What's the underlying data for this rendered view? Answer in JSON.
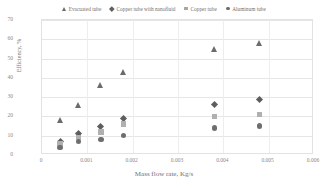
{
  "chart_data": {
    "type": "scatter",
    "title": "",
    "xlabel": "Mass flow rate, Kg/s",
    "ylabel": "Efficiency, %",
    "xlim": [
      0,
      0.006
    ],
    "ylim": [
      0,
      70
    ],
    "xticks": [
      "0",
      "0.001",
      "0.002",
      "0.003",
      "0.004",
      "0.005",
      "0.006"
    ],
    "yticks": [
      "0",
      "10",
      "20",
      "30",
      "40",
      "50",
      "60",
      "70"
    ],
    "grid": true,
    "legend_position": "top",
    "x": [
      0.0004,
      0.0008,
      0.0013,
      0.0018,
      0.0038,
      0.0048
    ],
    "series": [
      {
        "name": "Evacuated tube",
        "marker": "triangle",
        "color": "#6b6b6b",
        "values": [
          18,
          26,
          36,
          43,
          55,
          58
        ]
      },
      {
        "name": "Copper tube with nanofluid",
        "marker": "diamond",
        "color": "#5d5d5d",
        "values": [
          7,
          11,
          15,
          19,
          26,
          29
        ]
      },
      {
        "name": "Copper tube",
        "marker": "square",
        "color": "#b0b0b0",
        "values": [
          6,
          9,
          12,
          16,
          20,
          21
        ]
      },
      {
        "name": "Aluminum tube",
        "marker": "circle",
        "color": "#6e6e6e",
        "values": [
          4,
          7,
          8,
          10,
          14,
          15
        ]
      }
    ]
  },
  "legend": {
    "items": [
      {
        "label": "Evacuated tube",
        "marker": "triangle"
      },
      {
        "label": "Copper tube with nanofluid",
        "marker": "diamond"
      },
      {
        "label": "Copper tube",
        "marker": "square"
      },
      {
        "label": "Aluminum tube",
        "marker": "circle"
      }
    ]
  }
}
